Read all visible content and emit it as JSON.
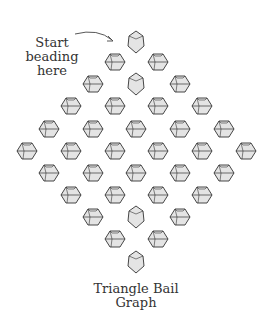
{
  "annotation": {
    "line1": "Start",
    "line2": "beading",
    "line3": "here"
  },
  "caption": {
    "line1": "Triangle Bail",
    "line2": "Graph"
  },
  "colors": {
    "stroke": "#333333",
    "fill": "#e4e4e4"
  },
  "beads": [
    {
      "x": 136,
      "y": 42,
      "type": "vertical"
    },
    {
      "x": 115,
      "y": 62,
      "type": "horizontal"
    },
    {
      "x": 158,
      "y": 62,
      "type": "horizontal"
    },
    {
      "x": 93,
      "y": 84,
      "type": "horizontal"
    },
    {
      "x": 136,
      "y": 84,
      "type": "vertical"
    },
    {
      "x": 180,
      "y": 84,
      "type": "horizontal"
    },
    {
      "x": 71,
      "y": 106,
      "type": "horizontal"
    },
    {
      "x": 115,
      "y": 106,
      "type": "horizontal"
    },
    {
      "x": 158,
      "y": 106,
      "type": "horizontal"
    },
    {
      "x": 202,
      "y": 106,
      "type": "horizontal"
    },
    {
      "x": 49,
      "y": 129,
      "type": "horizontal"
    },
    {
      "x": 93,
      "y": 129,
      "type": "horizontal"
    },
    {
      "x": 136,
      "y": 129,
      "type": "horizontal"
    },
    {
      "x": 180,
      "y": 129,
      "type": "horizontal"
    },
    {
      "x": 224,
      "y": 129,
      "type": "horizontal"
    },
    {
      "x": 27,
      "y": 151,
      "type": "horizontal"
    },
    {
      "x": 71,
      "y": 151,
      "type": "horizontal"
    },
    {
      "x": 115,
      "y": 151,
      "type": "horizontal"
    },
    {
      "x": 158,
      "y": 151,
      "type": "horizontal"
    },
    {
      "x": 202,
      "y": 151,
      "type": "horizontal"
    },
    {
      "x": 246,
      "y": 151,
      "type": "horizontal"
    },
    {
      "x": 49,
      "y": 173,
      "type": "horizontal"
    },
    {
      "x": 93,
      "y": 173,
      "type": "horizontal"
    },
    {
      "x": 136,
      "y": 173,
      "type": "horizontal"
    },
    {
      "x": 180,
      "y": 173,
      "type": "horizontal"
    },
    {
      "x": 224,
      "y": 173,
      "type": "horizontal"
    },
    {
      "x": 71,
      "y": 195,
      "type": "horizontal"
    },
    {
      "x": 115,
      "y": 195,
      "type": "horizontal"
    },
    {
      "x": 158,
      "y": 195,
      "type": "horizontal"
    },
    {
      "x": 202,
      "y": 195,
      "type": "horizontal"
    },
    {
      "x": 93,
      "y": 217,
      "type": "horizontal"
    },
    {
      "x": 136,
      "y": 217,
      "type": "vertical"
    },
    {
      "x": 180,
      "y": 217,
      "type": "horizontal"
    },
    {
      "x": 115,
      "y": 239,
      "type": "horizontal"
    },
    {
      "x": 158,
      "y": 239,
      "type": "horizontal"
    },
    {
      "x": 136,
      "y": 262,
      "type": "vertical"
    }
  ]
}
